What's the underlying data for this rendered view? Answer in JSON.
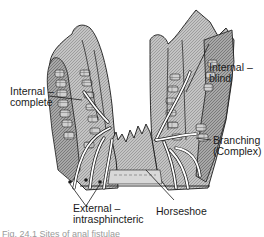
{
  "figure": {
    "labels": {
      "internal_complete": [
        "Internal –",
        "complete"
      ],
      "internal_blind": [
        "Internal –",
        "blind"
      ],
      "branching": [
        "Branching",
        "(Complex)"
      ],
      "external": [
        "External –",
        "intrasphincteric"
      ],
      "horseshoe": "Horseshoe"
    },
    "caption": "Fig. 24.1 Sites of anal fistulae"
  },
  "colors": {
    "tissue_fill": "#b8b8b8",
    "tissue_dark": "#8a8a8a",
    "line": "#1a1a1a",
    "tract": "#ffffff",
    "background": "#ffffff"
  }
}
